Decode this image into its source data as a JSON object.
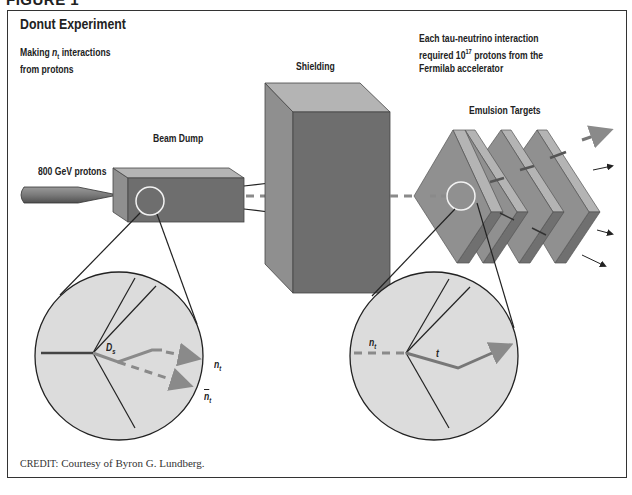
{
  "figure_label": "FIGURE 1",
  "title": "Donut Experiment",
  "note_left": {
    "line1_prefix": "Making ",
    "symbol": "n",
    "symbol_sub": "t",
    "line1_suffix": " interactions",
    "line2": "from protons"
  },
  "note_right": {
    "line1": "Each tau-neutrino interaction",
    "line2_prefix": "required 10",
    "line2_sup": "17",
    "line2_suffix": " protons from the",
    "line3": "Fermilab accelerator"
  },
  "labels": {
    "protons": "800 GeV protons",
    "beam_dump": "Beam Dump",
    "shielding": "Shielding",
    "emulsion_targets": "Emulsion Targets"
  },
  "inset_left": {
    "vertex_label": "D",
    "vertex_sub": "s",
    "neutrino_label": "n",
    "neutrino_sub": "t",
    "antineutrino_label": "n",
    "antineutrino_sub": "t"
  },
  "inset_right": {
    "incoming_label": "n",
    "incoming_sub": "t",
    "tau_label": "t"
  },
  "credit": {
    "prefix": "CREDIT:",
    "text": " Courtesy of Byron G. Lundberg."
  },
  "colors": {
    "box_dark": "#6e6e6e",
    "box_mid": "#8f8f8f",
    "box_light": "#b4b4b4",
    "inset_fill": "#dcdcdc",
    "track_gray": "#8a8a8a",
    "line_dark": "#222222",
    "circle_highlight": "#f2f2f2"
  }
}
